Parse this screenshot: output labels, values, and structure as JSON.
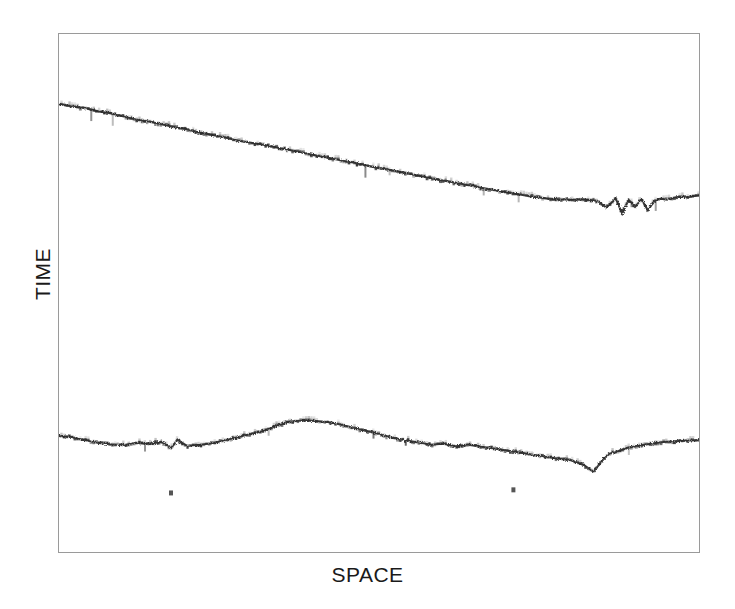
{
  "figure": {
    "title": "",
    "background_color": "#ffffff",
    "frame_color": "#9a9a9a",
    "trace_color": "#2b2b2b"
  },
  "axes": {
    "xlabel": "SPACE",
    "ylabel": "TIME"
  },
  "chart_data": {
    "type": "line",
    "title": "",
    "xlabel": "SPACE",
    "ylabel": "TIME",
    "grid": false,
    "legend": null,
    "axis_ticks": {
      "x": [],
      "y": []
    },
    "xlim": [
      0,
      100
    ],
    "ylim": [
      0,
      100
    ],
    "note": "Space-time (seismic style) plot. Two noisy quasi-linear event traces drawn as stippled dark bands on white. TIME axis increases downward. No numeric tick labels are printed on either axis.",
    "series": [
      {
        "name": "upper-event",
        "description": "Steadily descending (in plot coords) noisy event; becomes scattered and spiky near the right edge.",
        "x": [
          0.0,
          2.0,
          4.0,
          6.0,
          8.0,
          10.0,
          12.0,
          14.0,
          16.0,
          18.0,
          20.0,
          22.0,
          24.0,
          26.0,
          28.0,
          30.0,
          32.0,
          34.0,
          36.0,
          38.0,
          40.0,
          42.0,
          44.0,
          46.0,
          48.0,
          50.0,
          52.0,
          54.0,
          56.0,
          58.0,
          60.0,
          62.0,
          64.0,
          66.0,
          68.0,
          70.0,
          72.0,
          74.0,
          76.0,
          78.0,
          80.0,
          82.0,
          84.0,
          85.5,
          87.0,
          88.0,
          89.0,
          90.0,
          91.0,
          92.0,
          93.0,
          94.0,
          95.0,
          96.0,
          97.0,
          98.0,
          99.0,
          100.0
        ],
        "y": [
          13.5,
          14.0,
          14.3,
          14.9,
          15.3,
          15.9,
          16.5,
          16.9,
          17.4,
          18.0,
          18.4,
          19.0,
          19.5,
          20.0,
          20.6,
          21.0,
          21.4,
          21.9,
          22.4,
          22.9,
          23.4,
          23.9,
          24.4,
          24.8,
          25.4,
          25.9,
          26.3,
          26.8,
          27.3,
          27.8,
          28.3,
          28.7,
          29.2,
          29.7,
          30.1,
          30.6,
          31.0,
          31.4,
          31.7,
          31.9,
          32.0,
          31.9,
          32.2,
          33.5,
          31.8,
          34.7,
          32.0,
          33.4,
          31.9,
          34.0,
          32.3,
          31.8,
          32.0,
          31.6,
          31.4,
          31.5,
          31.3,
          31.2
        ]
      },
      {
        "name": "lower-event",
        "description": "Broad noisy event with a rise to a crest near x=44 then a gradual fall, a sharp notch near x=85, and recovery toward the right edge.",
        "x": [
          0.0,
          2.0,
          4.0,
          6.0,
          8.0,
          10.0,
          12.0,
          14.0,
          16.0,
          17.5,
          18.5,
          20.0,
          22.0,
          24.0,
          26.0,
          28.0,
          30.0,
          32.0,
          34.0,
          36.0,
          38.0,
          40.0,
          42.0,
          44.0,
          46.0,
          48.0,
          50.0,
          52.0,
          54.0,
          56.0,
          58.0,
          60.0,
          62.0,
          64.0,
          66.0,
          68.0,
          70.0,
          72.0,
          74.0,
          76.0,
          78.0,
          80.0,
          82.0,
          83.5,
          85.0,
          86.0,
          87.0,
          88.5,
          90.0,
          92.0,
          94.0,
          96.0,
          98.0,
          100.0
        ],
        "y": [
          77.6,
          77.8,
          78.4,
          78.9,
          79.2,
          79.4,
          78.9,
          79.2,
          78.7,
          80.0,
          78.3,
          79.5,
          79.3,
          79.0,
          78.4,
          77.8,
          77.2,
          76.6,
          75.7,
          74.8,
          74.6,
          74.7,
          74.9,
          75.4,
          76.0,
          76.6,
          77.2,
          77.9,
          78.4,
          78.8,
          79.3,
          79.1,
          79.6,
          79.2,
          79.7,
          80.0,
          80.4,
          80.8,
          81.2,
          81.6,
          82.0,
          82.3,
          83.2,
          84.5,
          82.2,
          81.0,
          80.7,
          80.0,
          79.6,
          79.2,
          78.8,
          78.6,
          78.5,
          78.4
        ]
      }
    ],
    "outlier_points": [
      {
        "x": 17.5,
        "y": 88.6,
        "label": "isolated-noise-burst-left"
      },
      {
        "x": 71.0,
        "y": 88.0,
        "label": "isolated-noise-burst-right"
      }
    ]
  }
}
